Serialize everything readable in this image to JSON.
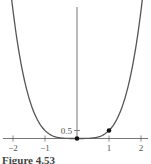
{
  "chart_data": {
    "type": "line",
    "title": "",
    "caption": "Figure 4.53",
    "function": "f(x) = x^4 / 2",
    "series": [
      {
        "name": "curve",
        "x": [
          -2.04,
          -2.0,
          -1.75,
          -1.5,
          -1.25,
          -1.0,
          -0.75,
          -0.5,
          -0.25,
          0.0,
          0.25,
          0.5,
          0.75,
          1.0,
          1.25,
          1.5,
          1.75,
          2.0,
          2.04
        ],
        "y": [
          8.66,
          8.0,
          4.69,
          2.53,
          1.22,
          0.5,
          0.16,
          0.03,
          0.002,
          0.0,
          0.002,
          0.03,
          0.16,
          0.5,
          1.22,
          2.53,
          4.69,
          8.0,
          8.66
        ]
      }
    ],
    "points": [
      {
        "x": 0,
        "y": 0
      },
      {
        "x": 1,
        "y": 0.5
      }
    ],
    "xlabel": "",
    "ylabel": "",
    "x_ticks": [
      -2,
      -1,
      1,
      2
    ],
    "x_tick_labels": [
      "−2",
      "−1",
      "1",
      "2"
    ],
    "y_ticks": [
      0.5
    ],
    "y_tick_labels": [
      "0.5"
    ],
    "xlim": [
      -2.3,
      2.2
    ],
    "ylim": [
      0,
      8.6
    ],
    "grid": false,
    "legend": null,
    "colors": {
      "curve": "#555555",
      "axis": "#666666",
      "point": "#111111"
    }
  }
}
